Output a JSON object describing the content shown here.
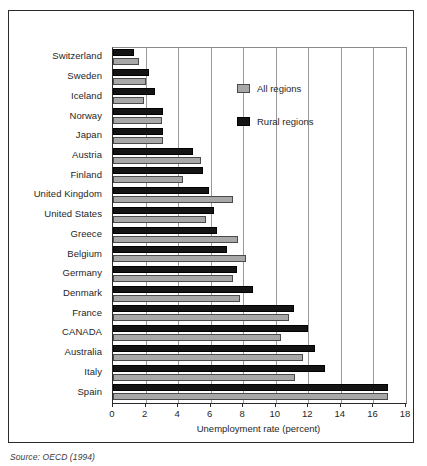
{
  "figure": {
    "source_note": "Source: OECD (1994)"
  },
  "chart_data": {
    "type": "bar",
    "orientation": "horizontal",
    "title": "",
    "subtitle": "",
    "xlabel": "Unemployment rate (percent)",
    "ylabel": "",
    "xlim": [
      0,
      18
    ],
    "xticks": [
      0,
      2,
      4,
      6,
      8,
      10,
      12,
      14,
      16,
      18
    ],
    "xtick_labels": [
      "0",
      "2",
      "4",
      "6",
      "8",
      "10",
      "12",
      "14",
      "16",
      "18"
    ],
    "grid": "vertical",
    "legend_position": "upper-right-inside",
    "categories": [
      "Switzerland",
      "Sweden",
      "Iceland",
      "Norway",
      "Japan",
      "Austria",
      "Finland",
      "United Kingdom",
      "United States",
      "Greece",
      "Belgium",
      "Germany",
      "Denmark",
      "France",
      "CANADA",
      "Australia",
      "Italy",
      "Spain"
    ],
    "series": [
      {
        "name": "All regions",
        "color": "#a8a8a8",
        "values": [
          1.6,
          2.0,
          1.9,
          3.0,
          3.1,
          5.4,
          4.3,
          7.4,
          5.7,
          7.7,
          8.2,
          7.4,
          7.8,
          10.8,
          10.3,
          11.7,
          11.2,
          16.9
        ]
      },
      {
        "name": "Rural regions",
        "color": "#141414",
        "values": [
          1.3,
          2.2,
          2.6,
          3.1,
          3.1,
          4.9,
          5.5,
          5.9,
          6.2,
          6.4,
          7.0,
          7.6,
          8.6,
          11.1,
          12.0,
          12.4,
          13.0,
          16.9
        ]
      }
    ]
  }
}
